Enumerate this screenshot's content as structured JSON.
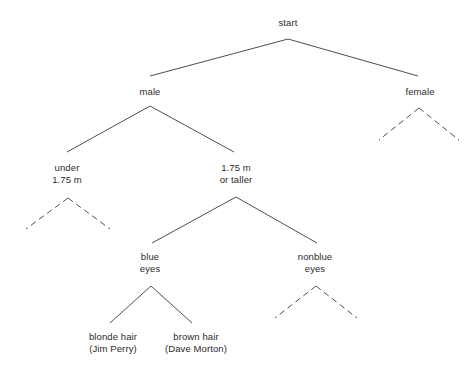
{
  "diagram": {
    "background_color": "#ffffff",
    "line_color": "#3a3a3a",
    "text_color": "#2b2b2b",
    "nodes": [
      {
        "id": "start",
        "label": "start",
        "label2": "",
        "x": 288,
        "y": 17
      },
      {
        "id": "male",
        "label": "male",
        "label2": "",
        "x": 150,
        "y": 86
      },
      {
        "id": "female",
        "label": "female",
        "label2": "",
        "x": 420,
        "y": 86
      },
      {
        "id": "under-175",
        "label": "under",
        "label2": "1.75 m",
        "x": 67,
        "y": 162
      },
      {
        "id": "175-or-taller",
        "label": "1.75 m",
        "label2": "or taller",
        "x": 236,
        "y": 162
      },
      {
        "id": "blue-eyes",
        "label": "blue",
        "label2": "eyes",
        "x": 150,
        "y": 251
      },
      {
        "id": "nonblue-eyes",
        "label": "nonblue",
        "label2": "eyes",
        "x": 315,
        "y": 251
      },
      {
        "id": "blonde-hair",
        "label": "blonde hair",
        "label2": "(Jim Perry)",
        "x": 113,
        "y": 331
      },
      {
        "id": "brown-hair",
        "label": "brown hair",
        "label2": "(Dave Morton)",
        "x": 196,
        "y": 331
      }
    ],
    "edges": [
      {
        "id": "start-male",
        "from": "start",
        "to": "male",
        "style": "solid",
        "x1": 288,
        "y1": 39,
        "x2": 150,
        "y2": 76
      },
      {
        "id": "start-female",
        "from": "start",
        "to": "female",
        "style": "solid",
        "x1": 288,
        "y1": 39,
        "x2": 418,
        "y2": 76
      },
      {
        "id": "male-under175",
        "from": "male",
        "to": "under-175",
        "style": "solid",
        "x1": 150,
        "y1": 106,
        "x2": 67,
        "y2": 152
      },
      {
        "id": "male-175ortaller",
        "from": "male",
        "to": "175-or-taller",
        "style": "solid",
        "x1": 150,
        "y1": 106,
        "x2": 234,
        "y2": 152
      },
      {
        "id": "female-left-elided",
        "from": "female",
        "to": "",
        "style": "dashed",
        "x1": 419,
        "y1": 108,
        "x2": 379,
        "y2": 140
      },
      {
        "id": "female-right-elided",
        "from": "female",
        "to": "",
        "style": "dashed",
        "x1": 419,
        "y1": 108,
        "x2": 459,
        "y2": 140
      },
      {
        "id": "under175-left-elided",
        "from": "under-175",
        "to": "",
        "style": "dashed",
        "x1": 68,
        "y1": 198,
        "x2": 26,
        "y2": 229
      },
      {
        "id": "under175-right-elided",
        "from": "under-175",
        "to": "",
        "style": "dashed",
        "x1": 68,
        "y1": 198,
        "x2": 110,
        "y2": 229
      },
      {
        "id": "taller-blue",
        "from": "175-or-taller",
        "to": "blue-eyes",
        "style": "solid",
        "x1": 236,
        "y1": 197,
        "x2": 152,
        "y2": 243
      },
      {
        "id": "taller-nonblue",
        "from": "175-or-taller",
        "to": "nonblue-eyes",
        "style": "solid",
        "x1": 236,
        "y1": 197,
        "x2": 317,
        "y2": 243
      },
      {
        "id": "blue-blonde",
        "from": "blue-eyes",
        "to": "blonde-hair",
        "style": "solid",
        "x1": 151,
        "y1": 286,
        "x2": 110,
        "y2": 323
      },
      {
        "id": "blue-brown",
        "from": "blue-eyes",
        "to": "brown-hair",
        "style": "solid",
        "x1": 151,
        "y1": 286,
        "x2": 192,
        "y2": 323
      },
      {
        "id": "nonblue-left-elided",
        "from": "nonblue-eyes",
        "to": "",
        "style": "dashed",
        "x1": 316,
        "y1": 286,
        "x2": 275,
        "y2": 318
      },
      {
        "id": "nonblue-right-elided",
        "from": "nonblue-eyes",
        "to": "",
        "style": "dashed",
        "x1": 316,
        "y1": 286,
        "x2": 357,
        "y2": 318
      }
    ]
  }
}
